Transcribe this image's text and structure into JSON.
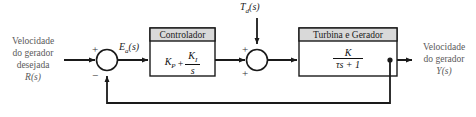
{
  "diagram": {
    "type": "control-system-block-diagram",
    "language": "pt-BR",
    "stroke_color": "#1a1a1a",
    "header_fill": "#d9d9d9",
    "text_color": "#555555"
  },
  "input": {
    "line1": "Velocidade",
    "line2": "do gerador",
    "line3": "desejada",
    "symbol": "R(s)"
  },
  "output": {
    "line1": "Velocidade",
    "line2": "do gerador",
    "symbol": "Y(s)"
  },
  "disturbance": {
    "symbol": "Td(s)",
    "base": "T",
    "sub": "d",
    "tail": "(s)"
  },
  "error_signal": {
    "base": "E",
    "sub": "a",
    "tail": "(s)"
  },
  "sum1": {
    "name": "comparator",
    "sign_top": "+",
    "sign_bottom": "−"
  },
  "sum2": {
    "name": "disturbance-adder",
    "sign_top": "+",
    "sign_bottom": "+"
  },
  "controller_block": {
    "title": "Controlador",
    "term1_base": "K",
    "term1_sub": "P",
    "operator": "+",
    "numerator_base": "K",
    "numerator_sub": "I",
    "denominator": "s"
  },
  "plant_block": {
    "title": "Turbina e Gerador",
    "numerator": "K",
    "denominator": "τs + 1"
  }
}
